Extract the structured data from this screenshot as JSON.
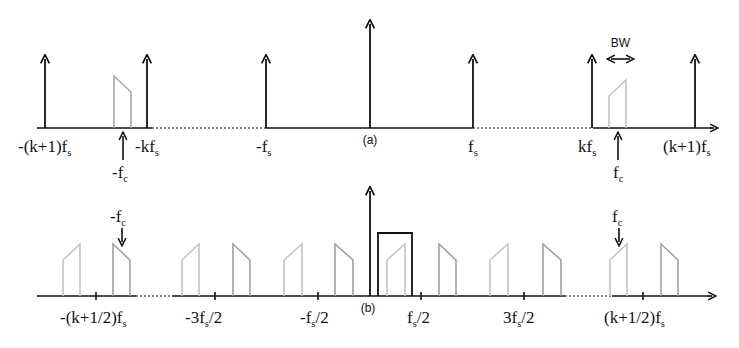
{
  "figure": {
    "panel_a": {
      "label": "(a)",
      "axis": {
        "y": 128,
        "x_start": 37,
        "x_end": 712,
        "dotted_segments": [
          [
            152,
            266
          ],
          [
            473,
            593
          ]
        ]
      },
      "impulses": [
        {
          "name": "-(k+1)fs",
          "x": 45,
          "top": 59
        },
        {
          "name": "-kfs",
          "x": 147,
          "top": 59
        },
        {
          "name": "-fs",
          "x": 266,
          "top": 59
        },
        {
          "name": "dc",
          "x": 370,
          "top": 24
        },
        {
          "name": "fs",
          "x": 473,
          "top": 59
        },
        {
          "name": "kfs",
          "x": 592,
          "top": 59
        },
        {
          "name": "(k+1)fs",
          "x": 695,
          "top": 59
        }
      ],
      "bands": [
        {
          "name": "band-neg-fc",
          "x1": 114,
          "x2": 131,
          "h1": 52,
          "h2": 36,
          "color": "#a8a8a8"
        },
        {
          "name": "band-pos-fc",
          "x1": 609,
          "x2": 626,
          "h1": 32,
          "h2": 48,
          "color": "#c4c4c4"
        }
      ],
      "tick_labels": [
        {
          "main": "-(k+1)f",
          "sub": "s",
          "x": 18,
          "y": 152
        },
        {
          "main": "-kf",
          "sub": "s",
          "x": 135,
          "y": 152
        },
        {
          "main": "-f",
          "sub": "s",
          "x": 256,
          "y": 152
        },
        {
          "main": "f",
          "sub": "s",
          "x": 468,
          "y": 152
        },
        {
          "main": "kf",
          "sub": "s",
          "x": 578,
          "y": 152
        },
        {
          "main": "(k+1)f",
          "sub": "s",
          "x": 663,
          "y": 152
        }
      ],
      "pointers": [
        {
          "name": "-fc",
          "label": "-f",
          "sub": "c",
          "x": 123,
          "label_x": 112
        },
        {
          "name": "fc",
          "label": "f",
          "sub": "c",
          "x": 618,
          "label_x": 613
        }
      ],
      "bw": {
        "label": "BW",
        "x1": 608,
        "x2": 633,
        "y": 59
      }
    },
    "panel_b": {
      "label": "(b)",
      "axis": {
        "y": 296,
        "x_start": 37,
        "x_end": 710,
        "dotted_segments": [
          [
            136,
            172
          ],
          [
            565,
            612
          ]
        ]
      },
      "dc_impulse": {
        "x": 370,
        "top": 191
      },
      "lowpass_filter": {
        "x1": 378,
        "x2": 412,
        "top": 233
      },
      "ticks": [
        {
          "x": 96
        },
        {
          "x": 215
        },
        {
          "x": 318
        },
        {
          "x": 421
        },
        {
          "x": 524
        },
        {
          "x": 643
        }
      ],
      "tick_labels": [
        {
          "main": "-(k+1/2)f",
          "sub": "s",
          "x": 60,
          "y": 323
        },
        {
          "main": "-3f",
          "sub": "s",
          "tail": "/2",
          "x": 185,
          "y": 323
        },
        {
          "main": "-f",
          "sub": "s",
          "tail": "/2",
          "x": 300,
          "y": 323
        },
        {
          "main": "f",
          "sub": "s",
          "tail": "/2",
          "x": 407,
          "y": 323
        },
        {
          "main": "3f",
          "sub": "s",
          "tail": "/2",
          "x": 503,
          "y": 323
        },
        {
          "main": "(k+1/2)f",
          "sub": "s",
          "x": 604,
          "y": 323
        }
      ],
      "images": [
        {
          "x1": 63,
          "x2": 80,
          "dir": "up",
          "color": "#c4c4c4"
        },
        {
          "x1": 113,
          "x2": 130,
          "dir": "down",
          "color": "#a0a0a0"
        },
        {
          "x1": 182,
          "x2": 199,
          "dir": "up",
          "color": "#c4c4c4"
        },
        {
          "x1": 233,
          "x2": 250,
          "dir": "down",
          "color": "#a0a0a0"
        },
        {
          "x1": 284,
          "x2": 302,
          "dir": "up",
          "color": "#c4c4c4"
        },
        {
          "x1": 335,
          "x2": 353,
          "dir": "down",
          "color": "#a0a0a0"
        },
        {
          "x1": 387,
          "x2": 405,
          "dir": "up",
          "color": "#c4c4c4"
        },
        {
          "x1": 439,
          "x2": 456,
          "dir": "down",
          "color": "#a0a0a0"
        },
        {
          "x1": 490,
          "x2": 508,
          "dir": "up",
          "color": "#c4c4c4"
        },
        {
          "x1": 543,
          "x2": 561,
          "dir": "down",
          "color": "#a0a0a0"
        },
        {
          "x1": 610,
          "x2": 627,
          "dir": "up",
          "color": "#c4c4c4"
        },
        {
          "x1": 661,
          "x2": 678,
          "dir": "down",
          "color": "#a0a0a0"
        }
      ],
      "pointers": [
        {
          "name": "-fc",
          "label": "-f",
          "sub": "c",
          "x": 122,
          "label_x": 110
        },
        {
          "name": "fc",
          "label": "f",
          "sub": "c",
          "x": 619,
          "label_x": 612
        }
      ]
    },
    "colors": {
      "ink": "#111111",
      "band_dark": "#a0a0a0",
      "band_light": "#c4c4c4"
    }
  }
}
